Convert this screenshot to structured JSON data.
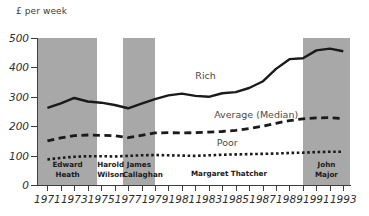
{
  "chart_data": {
    "type": "line",
    "title": "",
    "ylabel": "£ per week",
    "xlabel": "",
    "ylim": [
      0,
      500
    ],
    "xlim": [
      1970.3,
      1993.5
    ],
    "yticks": [
      "0",
      "100",
      "200",
      "300",
      "400",
      "500"
    ],
    "ytick_values": [
      0,
      100,
      200,
      300,
      400,
      500
    ],
    "xticks": [
      "1971",
      "1973",
      "1975",
      "1977",
      "1979",
      "1981",
      "1983",
      "1985",
      "1987",
      "1989",
      "1991",
      "1993"
    ],
    "xtick_values": [
      1971,
      1973,
      1975,
      1977,
      1979,
      1981,
      1983,
      1985,
      1987,
      1989,
      1991,
      1993
    ],
    "x": [
      1971,
      1972,
      1973,
      1974,
      1975,
      1976,
      1977,
      1978,
      1979,
      1980,
      1981,
      1982,
      1983,
      1984,
      1985,
      1986,
      1987,
      1988,
      1989,
      1990,
      1991,
      1992,
      1993
    ],
    "grid": false,
    "legend_position": "inline-annotations",
    "series": [
      {
        "name": "Rich",
        "style": "solid",
        "color": "#1a1a1a",
        "values": [
          262,
          278,
          296,
          284,
          280,
          272,
          261,
          277,
          292,
          305,
          311,
          303,
          300,
          312,
          316,
          330,
          352,
          395,
          428,
          431,
          458,
          464,
          455
        ]
      },
      {
        "name": "Average (Median)",
        "style": "dashed",
        "color": "#1a1a1a",
        "values": [
          150,
          160,
          168,
          170,
          169,
          168,
          161,
          169,
          177,
          178,
          177,
          178,
          180,
          182,
          186,
          192,
          200,
          210,
          219,
          225,
          228,
          229,
          226
        ]
      },
      {
        "name": "Poor",
        "style": "dotted",
        "color": "#1a1a1a",
        "values": [
          87,
          92,
          96,
          98,
          98,
          97,
          99,
          101,
          102,
          101,
          100,
          99,
          101,
          103,
          104,
          105,
          106,
          107,
          109,
          110,
          112,
          113,
          113
        ]
      }
    ],
    "annotations": [
      {
        "text": "Rich",
        "x": 1982.0,
        "y": 370
      },
      {
        "text": "Average (Median)",
        "x": 1983.4,
        "y": 238
      },
      {
        "text": "Poor",
        "x": 1983.6,
        "y": 143
      }
    ],
    "bands": [
      {
        "label_line1": "Edward",
        "label_line2": "Heath",
        "start": 1970.3,
        "end": 1974.7,
        "shaded": true,
        "lines": 2
      },
      {
        "label_line1": "Harold",
        "label_line2": "Wilson",
        "start": 1974.7,
        "end": 1976.6,
        "shaded": false,
        "lines": 2
      },
      {
        "label_line1": "James",
        "label_line2": "Callaghan",
        "start": 1976.6,
        "end": 1979.0,
        "shaded": true,
        "lines": 2
      },
      {
        "label_line1": "Margaret Thatcher",
        "label_line2": "",
        "start": 1979.0,
        "end": 1990.0,
        "shaded": false,
        "lines": 1
      },
      {
        "label_line1": "John",
        "label_line2": "Major",
        "start": 1990.0,
        "end": 1993.5,
        "shaded": true,
        "lines": 2
      }
    ],
    "band_shade_color": "#a8a8a8"
  }
}
